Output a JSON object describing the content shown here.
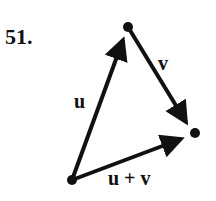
{
  "problem_number": "51.",
  "diagram": {
    "type": "vector-addition-triangle",
    "points": {
      "origin": [
        72,
        180
      ],
      "tip_u": [
        128,
        27
      ],
      "tip_sum": [
        195,
        133
      ]
    },
    "vectors": [
      {
        "name": "u",
        "from": "origin",
        "to": "tip_u",
        "label": "u"
      },
      {
        "name": "v",
        "from": "tip_u",
        "to": "tip_sum",
        "label": "v"
      },
      {
        "name": "u_plus_v",
        "from": "origin",
        "to": "tip_sum",
        "label": "u + v"
      }
    ],
    "color": "#111111"
  }
}
